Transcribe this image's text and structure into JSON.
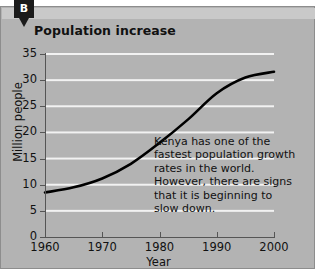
{
  "figure": {
    "panel_label": "B",
    "title": "Population increase",
    "background_color": "#b3b3b3",
    "gridline_color": "#f2f2f2",
    "curve_color": "#000000"
  },
  "annotation": {
    "lines": [
      "Kenya has one of the",
      "fastest population growth",
      "rates in the world.",
      "However, there are signs",
      "that it is beginning to",
      "slow down."
    ]
  },
  "chart_data": {
    "type": "line",
    "title": "Population increase",
    "xlabel": "Year",
    "ylabel": "Million people",
    "xlim": [
      1960,
      2000
    ],
    "ylim": [
      0,
      35
    ],
    "grid": true,
    "legend": "none",
    "xticks": [
      "1960",
      "1970",
      "1980",
      "1990",
      "2000"
    ],
    "yticks": [
      "0",
      "5",
      "10",
      "15",
      "20",
      "25",
      "30",
      "35"
    ],
    "series": [
      {
        "name": "Kenya population",
        "x": [
          1960,
          1965,
          1970,
          1975,
          1980,
          1985,
          1990,
          1995,
          2000
        ],
        "values": [
          8.5,
          9.5,
          11.2,
          14.0,
          18.0,
          22.5,
          27.5,
          30.5,
          31.6
        ]
      }
    ]
  }
}
